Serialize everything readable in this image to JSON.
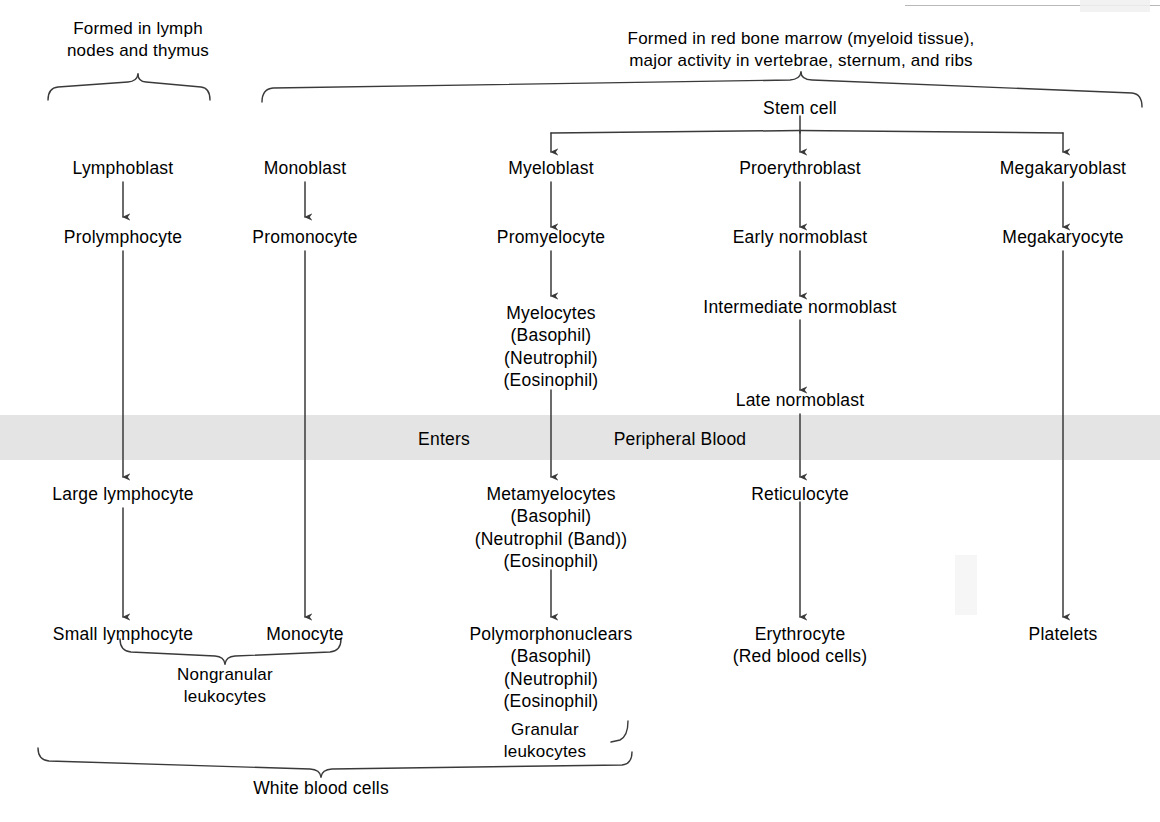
{
  "diagram": {
    "background_color": "#ffffff",
    "line_color": "#3a3a3a",
    "band_color": "#e4e4e4",
    "headers": [
      {
        "id": "lymph-header",
        "text": "Formed in lymph\nnodes and thymus"
      },
      {
        "id": "marrow-header",
        "text": "Formed in red bone marrow (myeloid tissue),\nmajor activity in vertebrae, sternum, and ribs"
      }
    ],
    "band": {
      "enters_label": "Enters",
      "peripheral_label": "Peripheral Blood"
    },
    "stem_cell": "Stem cell",
    "columns": [
      {
        "id": "lymphocyte-column",
        "nodes": [
          "Lymphoblast",
          "Prolymphocyte",
          "Large lymphocyte",
          "Small lymphocyte"
        ]
      },
      {
        "id": "monocyte-column",
        "nodes": [
          "Monoblast",
          "Promonocyte",
          "Monocyte"
        ]
      },
      {
        "id": "granulocyte-column",
        "nodes": [
          "Myeloblast",
          "Promyelocyte",
          "Myelocytes\n(Basophil)\n(Neutrophil)\n(Eosinophil)",
          "Metamyelocytes\n(Basophil)\n(Neutrophil (Band))\n(Eosinophil)",
          "Polymorphonuclears\n(Basophil)\n(Neutrophil)\n(Eosinophil)"
        ]
      },
      {
        "id": "erythrocyte-column",
        "nodes": [
          "Proerythroblast",
          "Early normoblast",
          "Intermediate normoblast",
          "Late normoblast",
          "Reticulocyte",
          "Erythrocyte\n(Red blood cells)"
        ]
      },
      {
        "id": "platelet-column",
        "nodes": [
          "Megakaryoblast",
          "Megakaryocyte",
          "Platelets"
        ]
      }
    ],
    "group_labels": [
      {
        "id": "nongranular-group",
        "text": "Nongranular\nleukocytes"
      },
      {
        "id": "granular-group",
        "text": "Granular\nleukocytes"
      },
      {
        "id": "wbc-group",
        "text": "White blood cells"
      }
    ]
  }
}
